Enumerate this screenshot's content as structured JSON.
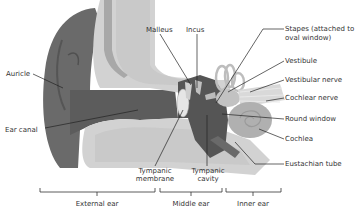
{
  "diagram": {
    "colors": {
      "background": "#ffffff",
      "auricle": "#6a6a6a",
      "ear_canal": "#5c5c5c",
      "bone_light": "#d2d2d2",
      "bone_texture": "#bdbdbd",
      "bone_inner": "#a8a8a8",
      "cochlea": "#b0b0b0",
      "middle_ear": "#555555",
      "label_text": "#333333",
      "leader_line": "#222222"
    },
    "labels": {
      "malleus": "Malleus",
      "incus": "Incus",
      "stapes_line1": "Stapes (attached to",
      "stapes_line2": "oval window)",
      "vestibule": "Vestibule",
      "vestibular_nerve": "Vestibular nerve",
      "cochlear_nerve": "Cochlear nerve",
      "round_window": "Round window",
      "cochlea": "Cochlea",
      "eustachian_tube": "Eustachian tube",
      "auricle": "Auricle",
      "ear_canal": "Ear canal",
      "tympanic_membrane_line1": "Tympanic",
      "tympanic_membrane_line2": "membrane",
      "tympanic_cavity_line1": "Tympanic",
      "tympanic_cavity_line2": "cavity"
    },
    "regions": {
      "external_ear": "External ear",
      "middle_ear": "Middle ear",
      "inner_ear": "Inner ear"
    }
  }
}
